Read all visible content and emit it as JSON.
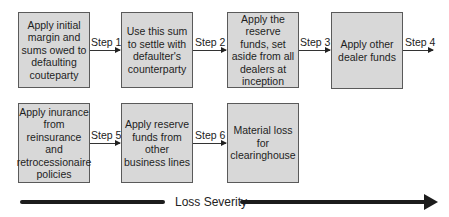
{
  "diagram": {
    "row1": [
      {
        "id": "box1",
        "text": "Apply initial margin and sums owed to defaulting couteparty"
      },
      {
        "id": "box2",
        "text": "Use this sum to settle with defaulter's counterparty"
      },
      {
        "id": "box3",
        "text": "Apply the reserve funds, set aside from all dealers at inception"
      },
      {
        "id": "box4",
        "text": "Apply other dealer funds"
      }
    ],
    "row2": [
      {
        "id": "box5",
        "text": "Apply inurance from reinsurance and retrocessionaire policies"
      },
      {
        "id": "box6",
        "text": "Apply reserve funds from other business lines"
      },
      {
        "id": "box7",
        "text": "Material loss for clearinghouse"
      }
    ],
    "steps": [
      "Step 1",
      "Step 2",
      "Step 3",
      "Step 4",
      "Step 5",
      "Step 6"
    ],
    "axis_label": "Loss Severity"
  }
}
